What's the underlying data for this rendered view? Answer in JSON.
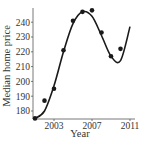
{
  "chart_data": {
    "type": "scatter",
    "title": "",
    "xlabel": "Year",
    "ylabel": "Median home price",
    "xlim": [
      2001,
      2011
    ],
    "ylim": [
      173,
      250
    ],
    "x_ticks": [
      "2003",
      "2007",
      "2011"
    ],
    "y_ticks": [
      "180",
      "190",
      "200",
      "210",
      "220",
      "230",
      "240"
    ],
    "grid": false,
    "legend": null,
    "series": [
      {
        "name": "Median home price",
        "kind": "points",
        "x": [
          2001,
          2002,
          2003,
          2004,
          2005,
          2006,
          2007,
          2008,
          2009,
          2010
        ],
        "y": [
          175,
          187,
          195,
          221,
          241,
          247,
          248,
          233,
          217,
          222
        ]
      },
      {
        "name": "Fitted curve",
        "kind": "line",
        "x": [
          2001,
          2002,
          2003,
          2004,
          2005,
          2006,
          2007,
          2008,
          2009,
          2010,
          2011
        ],
        "y": [
          175,
          180,
          197,
          220,
          239,
          247,
          244,
          231,
          217,
          214,
          237
        ]
      }
    ],
    "colors": {
      "points": "#1a1a1a",
      "curve": "#1a1a1a",
      "axis": "#444444"
    }
  }
}
